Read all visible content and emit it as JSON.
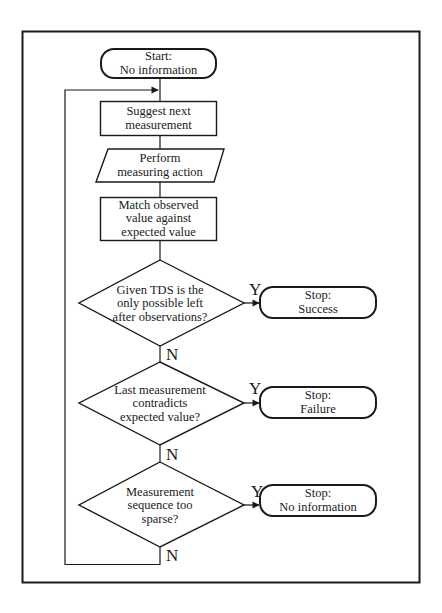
{
  "diagram": {
    "type": "flowchart",
    "nodes": {
      "start": {
        "shape": "terminal",
        "lines": [
          "Start:",
          "No information"
        ]
      },
      "suggest": {
        "shape": "process",
        "lines": [
          "Suggest next",
          "measurement"
        ]
      },
      "perform": {
        "shape": "io-parallelogram",
        "lines": [
          "Perform",
          "measuring action"
        ]
      },
      "match": {
        "shape": "process",
        "lines": [
          "Match observed",
          "value against",
          "expected value"
        ]
      },
      "decision1": {
        "shape": "decision",
        "lines": [
          "Given TDS is the",
          "only possible left",
          "after observations?"
        ]
      },
      "decision2": {
        "shape": "decision",
        "lines": [
          "Last measurement",
          "contradicts",
          "expected value?"
        ]
      },
      "decision3": {
        "shape": "decision",
        "lines": [
          "Measurement",
          "sequence too",
          "sparse?"
        ]
      },
      "stop_success": {
        "shape": "terminal",
        "lines": [
          "Stop:",
          "Success"
        ]
      },
      "stop_failure": {
        "shape": "terminal",
        "lines": [
          "Stop:",
          "Failure"
        ]
      },
      "stop_noinfo": {
        "shape": "terminal",
        "lines": [
          "Stop:",
          "No information"
        ]
      }
    },
    "branch_labels": {
      "d1_yes": "Y",
      "d1_no": "N",
      "d2_yes": "Y",
      "d2_no": "N",
      "d3_yes": "Y",
      "d3_no": "N"
    },
    "edges": [
      {
        "from": "start",
        "to": "suggest"
      },
      {
        "from": "suggest",
        "to": "perform"
      },
      {
        "from": "perform",
        "to": "match"
      },
      {
        "from": "match",
        "to": "decision1"
      },
      {
        "from": "decision1",
        "to": "stop_success",
        "label": "Y"
      },
      {
        "from": "decision1",
        "to": "decision2",
        "label": "N"
      },
      {
        "from": "decision2",
        "to": "stop_failure",
        "label": "Y"
      },
      {
        "from": "decision2",
        "to": "decision3",
        "label": "N"
      },
      {
        "from": "decision3",
        "to": "stop_noinfo",
        "label": "Y"
      },
      {
        "from": "decision3",
        "to": "suggest",
        "label": "N",
        "note": "loop back"
      }
    ]
  },
  "colors": {
    "stroke": "#1a1a1a",
    "background": "#ffffff"
  }
}
